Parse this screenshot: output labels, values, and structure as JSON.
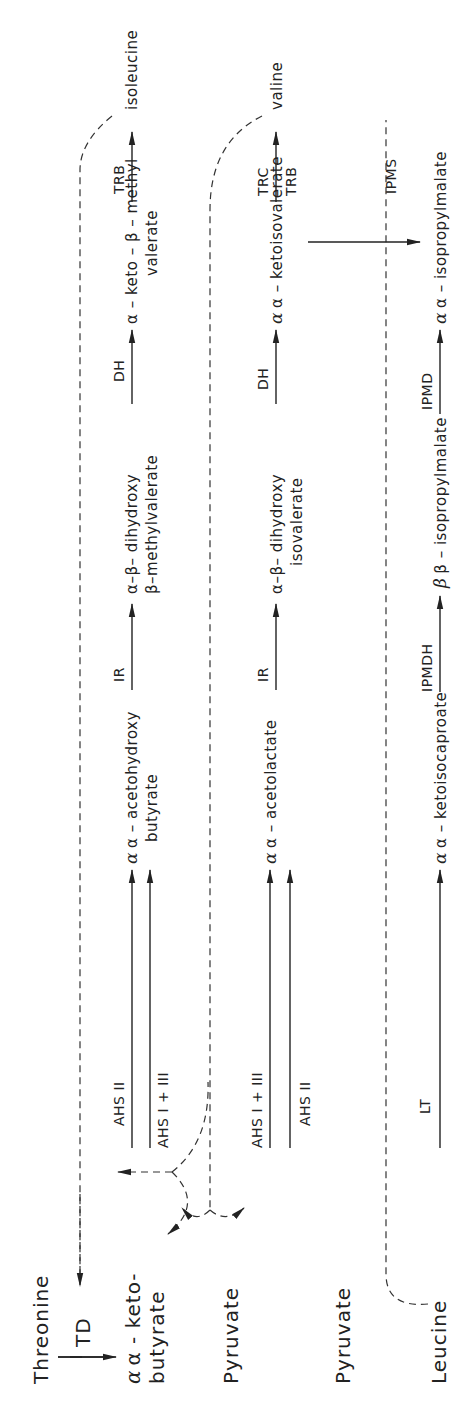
{
  "diagram": {
    "title": "",
    "orientation": "rotated -90deg (reads bottom-to-top)",
    "colors": {
      "ink": "#222222",
      "background": "#ffffff"
    },
    "start_nodes": {
      "threonine": "Threonine",
      "ketobutyrate_1": "α - keto-",
      "ketobutyrate_2": "butyrate",
      "pyruvate_a": "Pyruvate",
      "pyruvate_b": "Pyruvate",
      "leucine": "Leucine"
    },
    "enzymes": {
      "td": "TD",
      "ahs2_row1": "AHS II",
      "ahs13_row1": "AHS I + III",
      "ahs13_row2": "AHS I + III",
      "ahs2_row2": "AHS II",
      "lt": "LT",
      "ir_row1": "IR",
      "ir_row2": "IR",
      "ipmdh": "IPMDH",
      "dh_row1": "DH",
      "dh_row2": "DH",
      "ipmd": "IPMD",
      "trb_row1": "TRB",
      "trc_row2": "TRC",
      "trb_row2": "TRB",
      "ipms": "IPMS"
    },
    "rows": {
      "isoleucine": {
        "intermediate1_line1": "α – acetohydroxy",
        "intermediate1_line2": "butyrate",
        "intermediate2_line1": "α–β– dihydroxy",
        "intermediate2_line2": "β–methylvalerate",
        "intermediate3_line1": "α – keto – β – methyl",
        "intermediate3_line2": "valerate",
        "product": "isoleucine"
      },
      "valine": {
        "intermediate1": "α – acetolactate",
        "intermediate2_line1": "α–β– dihydroxy",
        "intermediate2_line2": "isovalerate",
        "intermediate3": "α – ketoisovalerate",
        "product": "valine"
      },
      "leucine": {
        "intermediate1": "α – ketoisocaproate",
        "intermediate2": "β – isopropylmalate",
        "intermediate3": "α – isopropylmalate"
      }
    }
  }
}
